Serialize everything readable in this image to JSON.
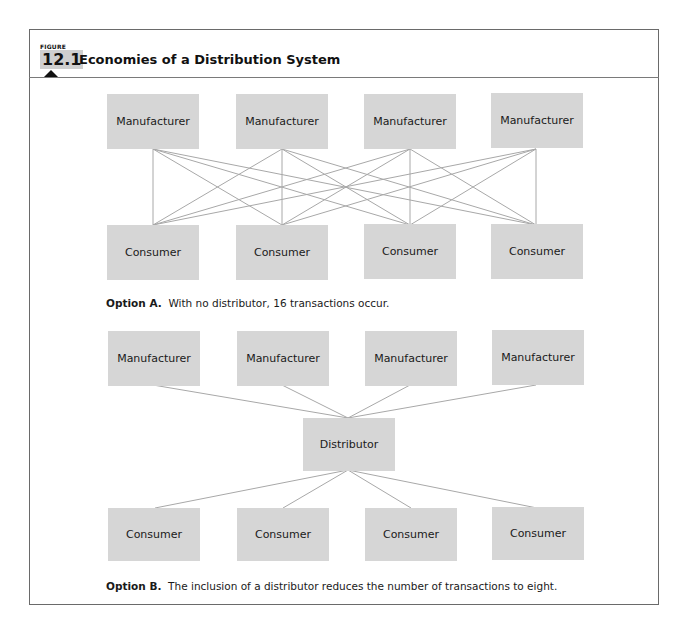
{
  "figure": {
    "label": "FIGURE",
    "number": "12.1",
    "title": "Economies of a Distribution System"
  },
  "option_a": {
    "manufacturers": [
      "Manufacturer",
      "Manufacturer",
      "Manufacturer",
      "Manufacturer"
    ],
    "consumers": [
      "Consumer",
      "Consumer",
      "Consumer",
      "Consumer"
    ],
    "caption_bold": "Option A.",
    "caption_text": "With no distributor, 16 transactions occur.",
    "transactions": 16
  },
  "option_b": {
    "manufacturers": [
      "Manufacturer",
      "Manufacturer",
      "Manufacturer",
      "Manufacturer"
    ],
    "distributor": "Distributor",
    "consumers": [
      "Consumer",
      "Consumer",
      "Consumer",
      "Consumer"
    ],
    "caption_bold": "Option B.",
    "caption_text": "The inclusion of a distributor reduces the number of transactions to eight.",
    "transactions": 8
  },
  "colors": {
    "box_fill": "#d6d6d6",
    "line": "#a8a8a8",
    "frame": "#6a6a6a"
  }
}
